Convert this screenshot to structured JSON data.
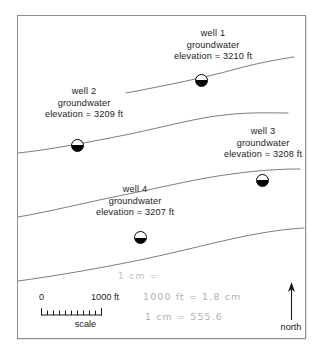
{
  "figure": {
    "type": "groundwater-contour-map",
    "title_visible": false
  },
  "wells": [
    {
      "id": "well-1",
      "name": "well 1",
      "line2": "groundwater",
      "line3": "elevation = 3210 ft",
      "elevation_ft": 3210,
      "symbol": "half-filled-circle-well-symbol"
    },
    {
      "id": "well-2",
      "name": "well 2",
      "line2": "groundwater",
      "line3": "elevation = 3209 ft",
      "elevation_ft": 3209,
      "symbol": "half-filled-circle-well-symbol"
    },
    {
      "id": "well-3",
      "name": "well 3",
      "line2": "groundwater",
      "line3": "elevation = 3208 ft",
      "elevation_ft": 3208,
      "symbol": "half-filled-circle-well-symbol"
    },
    {
      "id": "well-4",
      "name": "well 4",
      "line2": "groundwater",
      "line3": "elevation = 3207 ft",
      "elevation_ft": 3207,
      "symbol": "half-filled-circle-well-symbol"
    }
  ],
  "scale_bar": {
    "min_label": "0",
    "max_label": "1000 ft",
    "caption": "scale",
    "tick_count": 10
  },
  "north_arrow": {
    "caption": "north",
    "direction": "up"
  },
  "handwritten_notes": {
    "note_1": "1 cm =",
    "note_2": "1000 ft = 1.8 cm",
    "note_3": "1 cm = 555.6"
  },
  "colors": {
    "frame": "#8d8d8d",
    "contour_line": "#6e6e6e",
    "text": "#1b1b1b",
    "handwriting": "#b4b2ae",
    "well_fill": "#000000"
  }
}
